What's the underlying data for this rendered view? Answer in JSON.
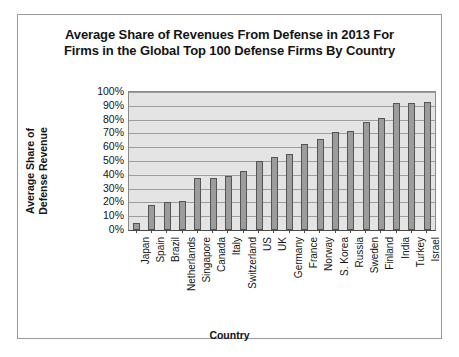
{
  "chart_data": {
    "type": "bar",
    "title": "Average Share of Revenues From Defense in 2013 For Firms in the Global Top 100 Defense Firms By Country",
    "title_line1": "Average Share of Revenues From Defense in 2013 For",
    "title_line2": "Firms in the Global Top 100 Defense Firms By Country",
    "xlabel": "Country",
    "ylabel": "Average Share of Defense Revenue",
    "ylabel_line1": "Average Share of",
    "ylabel_line2": "Defense Revenue",
    "ylim": [
      0,
      100
    ],
    "ytick_labels": [
      "100%",
      "90%",
      "80%",
      "70%",
      "60%",
      "50%",
      "40%",
      "30%",
      "20%",
      "10%",
      "0%"
    ],
    "ytick_values": [
      100,
      90,
      80,
      70,
      60,
      50,
      40,
      30,
      20,
      10,
      0
    ],
    "grid": true,
    "legend": false,
    "categories": [
      "Japan",
      "Spain",
      "Brazil",
      "Netherlands",
      "Singapore",
      "Canada",
      "Italy",
      "Switzerland",
      "US",
      "UK",
      "Germany",
      "France",
      "Norway",
      "S. Korea",
      "Russia",
      "Sweden",
      "Finland",
      "India",
      "Turkey",
      "Israel"
    ],
    "values": [
      5,
      18,
      20,
      21,
      38,
      38,
      39,
      43,
      50,
      53,
      55,
      62,
      66,
      71,
      72,
      78,
      81,
      92,
      92,
      93
    ],
    "bar_color": "#9c9c9c",
    "bar_border_color": "#545454",
    "plot_background": "#e4e4e4"
  }
}
